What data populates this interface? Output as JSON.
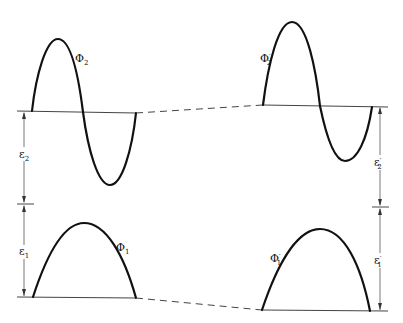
{
  "diagram": {
    "left": {
      "upper_wave": {
        "label": "Φ",
        "subscript": "2",
        "prime": ""
      },
      "lower_wave": {
        "label": "Φ",
        "subscript": "1",
        "prime": ""
      },
      "upper_energy": {
        "label": "ε",
        "subscript": "2",
        "prime": ""
      },
      "lower_energy": {
        "label": "ε",
        "subscript": "1",
        "prime": ""
      }
    },
    "right": {
      "upper_wave": {
        "label": "Φ",
        "subscript": "2",
        "prime": "′"
      },
      "lower_wave": {
        "label": "Φ",
        "subscript": "1",
        "prime": "′"
      },
      "upper_energy": {
        "label": "ε",
        "subscript": "2",
        "prime": "′"
      },
      "lower_energy": {
        "label": "ε",
        "subscript": "1",
        "prime": "′"
      }
    },
    "connectors": [
      "dashed line joining upper baselines",
      "dashed line joining lower baselines"
    ]
  }
}
